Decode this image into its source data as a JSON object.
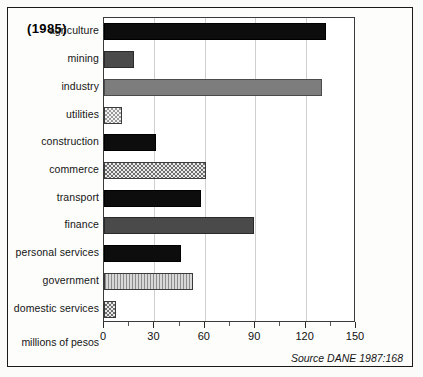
{
  "title": "(1985)",
  "axis_caption": "millions of pesos",
  "source": "Source DANE 1987:168",
  "chart_data": {
    "type": "bar",
    "orientation": "horizontal",
    "title": "(1985)",
    "subtitle": "",
    "xlabel": "millions of pesos",
    "ylabel": "",
    "xlim": [
      0,
      150
    ],
    "xticks": [
      0,
      30,
      60,
      90,
      120,
      150
    ],
    "xtick_labels": [
      "0",
      "30",
      "60",
      "90",
      "120",
      "150"
    ],
    "minor_tick_step": 15,
    "grid": "vertical major gridlines only",
    "legend": "none",
    "annotation": "Source DANE 1987:168",
    "categories": [
      "agriculture",
      "mining",
      "industry",
      "utilities",
      "construction",
      "commerce",
      "transport",
      "finance",
      "personal services",
      "government",
      "domestic services"
    ],
    "values": [
      132,
      18,
      130,
      11,
      31,
      61,
      58,
      89,
      46,
      53,
      7
    ],
    "fills": [
      "black",
      "dark-gray",
      "mid-gray",
      "light-checker",
      "black",
      "dense-checker",
      "black",
      "dark-gray",
      "black",
      "vertical-hatch",
      "dense-checker"
    ]
  }
}
